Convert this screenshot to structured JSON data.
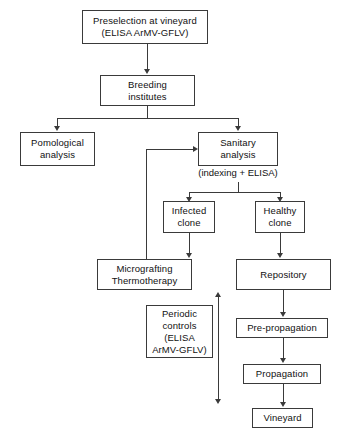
{
  "diagram": {
    "background_color": "#ffffff",
    "line_color": "#3a3a3a",
    "text_color": "#111111",
    "nodes": [
      {
        "id": "preselection",
        "line1": "Preselection at vineyard",
        "line2": "(ELISA ArMV-GFLV)"
      },
      {
        "id": "breeding",
        "line1": "Breeding",
        "line2": "institutes"
      },
      {
        "id": "pomological",
        "line1": "Pomological",
        "line2": "analysis"
      },
      {
        "id": "sanitary",
        "line1": "Sanitary",
        "line2": "analysis"
      },
      {
        "id": "infected",
        "line1": "Infected",
        "line2": "clone"
      },
      {
        "id": "healthy",
        "line1": "Healthy",
        "line2": "clone"
      },
      {
        "id": "micrografting",
        "line1": "Micrografting",
        "line2": "Thermotherapy"
      },
      {
        "id": "periodic",
        "line1": "Periodic",
        "line2": "controls",
        "line3": "(ELISA",
        "line4": "ArMV-GFLV)"
      },
      {
        "id": "repository",
        "line1": "Repository"
      },
      {
        "id": "prepropagation",
        "line1": "Pre-propagation"
      },
      {
        "id": "propagation",
        "line1": "Propagation"
      },
      {
        "id": "vineyard",
        "line1": "Vineyard"
      }
    ],
    "captions": [
      {
        "id": "indexing",
        "text": "(indexing + ELISA)"
      }
    ]
  }
}
